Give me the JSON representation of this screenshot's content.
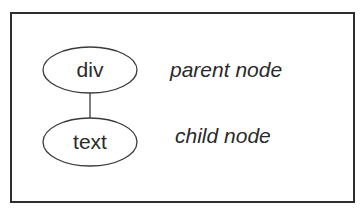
{
  "diagram": {
    "nodes": [
      {
        "id": "parent",
        "label": "div",
        "caption": "parent node"
      },
      {
        "id": "child",
        "label": "text",
        "caption": "child node"
      }
    ],
    "edges": [
      {
        "from": "parent",
        "to": "child"
      }
    ],
    "colors": {
      "stroke": "#2e2e2e",
      "text": "#2a2a2a",
      "background": "#ffffff"
    }
  }
}
